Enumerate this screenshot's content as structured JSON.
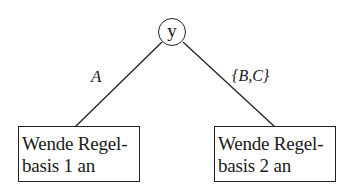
{
  "diagram": {
    "type": "decision-tree",
    "root": {
      "label": "y"
    },
    "edges": [
      {
        "label": "A",
        "to": "left"
      },
      {
        "label": "{B,C}",
        "to": "right"
      }
    ],
    "leaves": [
      {
        "id": "left",
        "line1": "Wende Regel-",
        "line2": "basis 1 an"
      },
      {
        "id": "right",
        "line1": "Wende Regel-",
        "line2": "basis 2 an"
      }
    ]
  }
}
